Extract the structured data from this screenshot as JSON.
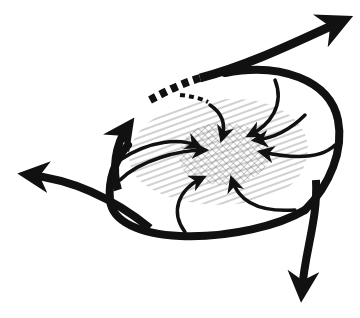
{
  "diagram": {
    "type": "flow-convergence-sketch",
    "background": "#ffffff",
    "ink_color": "#111111",
    "hatch_color": "#8a8a8a",
    "crosshatch_color": "#6a6a6a",
    "regions": [
      {
        "name": "outer-hatched-zone",
        "pattern": "diagonal-lines"
      },
      {
        "name": "inner-core-zone",
        "pattern": "cross-hatch"
      }
    ],
    "outer_arrows": [
      {
        "name": "outflow-arrow-upper-right",
        "direction": "up-right"
      },
      {
        "name": "outflow-arrow-left",
        "direction": "left"
      },
      {
        "name": "outflow-arrow-bottom",
        "direction": "down"
      },
      {
        "name": "outflow-arrow-upper-left",
        "direction": "up"
      },
      {
        "name": "dashed-outflow-path",
        "style": "dashed"
      }
    ],
    "inflow_arrows_count": 8
  }
}
